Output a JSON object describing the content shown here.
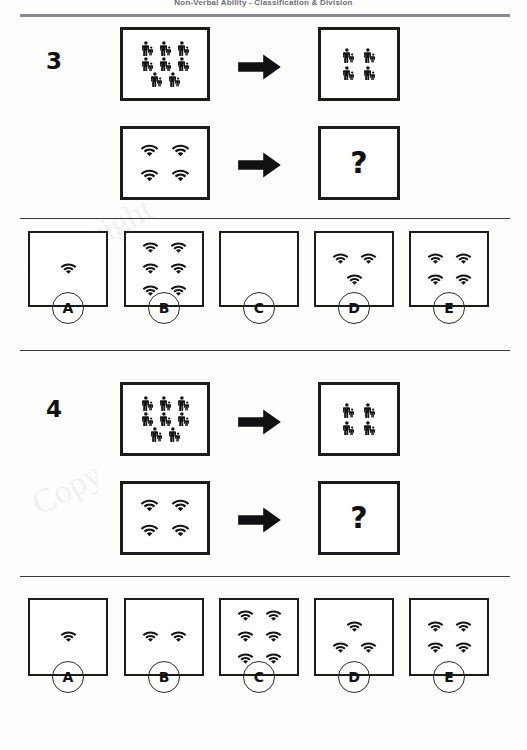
{
  "header": {
    "title": "Non-Verbal Ability  -  Classification & Division"
  },
  "watermarks": [
    "Copyright",
    "Copy"
  ],
  "glyphs": {
    "person": "person-icon",
    "wifi": "wifi-icon",
    "arrow": "right-arrow-icon",
    "question": "?"
  },
  "questions": [
    {
      "number": "3",
      "rows": [
        {
          "name": "example-row",
          "input": {
            "glyph": "person",
            "count": 8,
            "layout": [
              3,
              3,
              2
            ]
          },
          "arrow": "right-arrow-icon",
          "output": {
            "glyph": "person",
            "count": 4,
            "layout": [
              2,
              2
            ]
          }
        },
        {
          "name": "question-row",
          "input": {
            "glyph": "wifi",
            "count": 4,
            "layout": [
              2,
              2
            ]
          },
          "arrow": "right-arrow-icon",
          "output": {
            "glyph": "question",
            "label": "?"
          }
        }
      ],
      "options": [
        {
          "letter": "A",
          "glyph": "wifi",
          "count": 1,
          "layout": [
            1
          ]
        },
        {
          "letter": "B",
          "glyph": "wifi",
          "count": 6,
          "layout": [
            2,
            2,
            2
          ]
        },
        {
          "letter": "C",
          "glyph": "wifi",
          "count": 0,
          "layout": []
        },
        {
          "letter": "D",
          "glyph": "wifi",
          "count": 3,
          "layout": [
            2,
            1
          ]
        },
        {
          "letter": "E",
          "glyph": "wifi",
          "count": 4,
          "layout": [
            2,
            2
          ]
        }
      ]
    },
    {
      "number": "4",
      "rows": [
        {
          "name": "example-row",
          "input": {
            "glyph": "person",
            "count": 8,
            "layout": [
              3,
              3,
              2
            ]
          },
          "arrow": "right-arrow-icon",
          "output": {
            "glyph": "person",
            "count": 4,
            "layout": [
              2,
              2
            ]
          }
        },
        {
          "name": "question-row",
          "input": {
            "glyph": "wifi",
            "count": 4,
            "layout": [
              2,
              2
            ]
          },
          "arrow": "right-arrow-icon",
          "output": {
            "glyph": "question",
            "label": "?"
          }
        }
      ],
      "options": [
        {
          "letter": "A",
          "glyph": "wifi",
          "count": 1,
          "layout": [
            1
          ]
        },
        {
          "letter": "B",
          "glyph": "wifi",
          "count": 2,
          "layout": [
            2
          ]
        },
        {
          "letter": "C",
          "glyph": "wifi",
          "count": 6,
          "layout": [
            2,
            2,
            2
          ]
        },
        {
          "letter": "D",
          "glyph": "wifi",
          "count": 3,
          "layout": [
            1,
            2
          ]
        },
        {
          "letter": "E",
          "glyph": "wifi",
          "count": 4,
          "layout": [
            2,
            2
          ]
        }
      ]
    }
  ],
  "colors": {
    "ink": "#1c1c1c",
    "rule": "#8a8a8c",
    "paper": "#fdfdfc"
  }
}
